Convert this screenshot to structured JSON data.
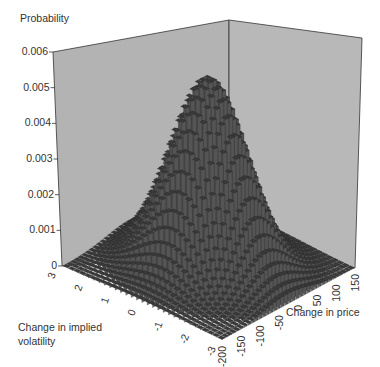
{
  "chart_data": {
    "type": "3d-bar",
    "title": "",
    "zlabel": "Probability",
    "xlabel": "Change in price",
    "ylabel": "Change in implied volatility",
    "z_ticks": [
      "0",
      "0.001",
      "0.002",
      "0.003",
      "0.004",
      "0.005",
      "0.006"
    ],
    "x_ticks": [
      "-200",
      "-150",
      "-100",
      "-50",
      "0",
      "50",
      "100",
      "150"
    ],
    "y_ticks": [
      "3",
      "2",
      "1",
      "0",
      "-1",
      "-2",
      "-3"
    ],
    "zlim": [
      0,
      0.006
    ],
    "xlim": [
      -200,
      150
    ],
    "ylim": [
      -3,
      3
    ],
    "peak": {
      "price": -25,
      "volatility": 0,
      "probability": 0.0053
    },
    "distribution": "bivariate normal histogram (approx.)",
    "colors": {
      "panel": "#b4b4b4",
      "bars": "#4a4a4a",
      "bar_highlight": "#9a9a9a"
    }
  },
  "labels": {
    "zlabel": "Probability",
    "xlabel": "Change in price",
    "ylabel_line1": "Change in implied",
    "ylabel_line2": "volatility"
  }
}
